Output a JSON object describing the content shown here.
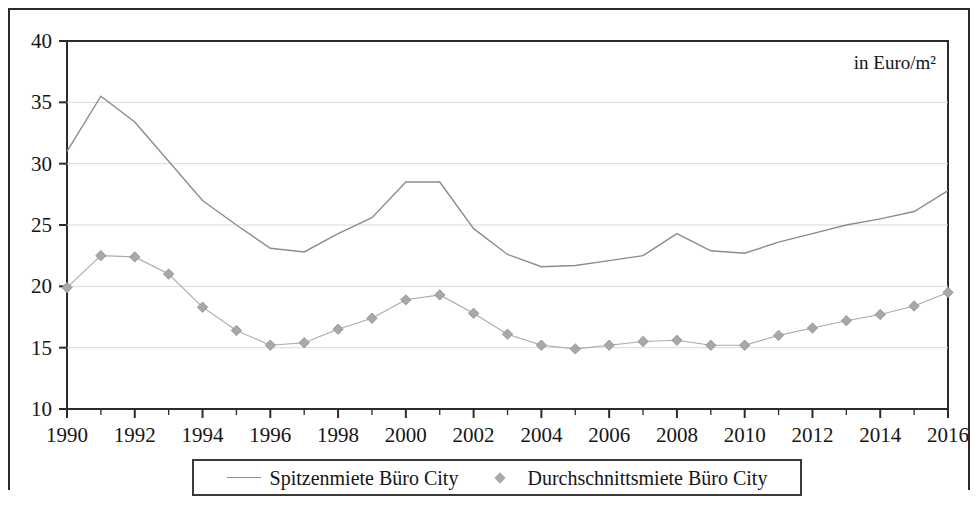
{
  "figure": {
    "unit_note": "in Euro/m²"
  },
  "legend": {
    "entries": [
      {
        "label": "Spitzenmiete Büro City",
        "marker": "line",
        "color": "#8c8c8c"
      },
      {
        "label": "Durchschnittsmiete Büro City",
        "marker": "diamond",
        "color": "#aaaaaa"
      }
    ]
  },
  "chart_data": {
    "type": "line",
    "title": "",
    "subtitle": "",
    "xlabel": "",
    "ylabel": "",
    "annotations": [
      "in Euro/m²"
    ],
    "grid": true,
    "grid_axis": "y",
    "legend_position": "bottom",
    "xlim": [
      1990,
      2016
    ],
    "ylim": [
      10,
      40
    ],
    "yticks": [
      10,
      15,
      20,
      25,
      30,
      35,
      40
    ],
    "ytick_labels": [
      "10",
      "15",
      "20",
      "25",
      "30",
      "35",
      "40"
    ],
    "x": [
      1990,
      1991,
      1992,
      1993,
      1994,
      1995,
      1996,
      1997,
      1998,
      1999,
      2000,
      2001,
      2002,
      2003,
      2004,
      2005,
      2006,
      2007,
      2008,
      2009,
      2010,
      2011,
      2012,
      2013,
      2014,
      2015,
      2016
    ],
    "xticks": [
      1990,
      1991,
      1992,
      1993,
      1994,
      1995,
      1996,
      1997,
      1998,
      1999,
      2000,
      2001,
      2002,
      2003,
      2004,
      2005,
      2006,
      2007,
      2008,
      2009,
      2010,
      2011,
      2012,
      2013,
      2014,
      2015,
      2016
    ],
    "xtick_labels_shown": [
      "1990",
      "1992",
      "1994",
      "1996",
      "1998",
      "2000",
      "2002",
      "2004",
      "2006",
      "2008",
      "2010",
      "2012",
      "2014",
      "2016"
    ],
    "series": [
      {
        "name": "Spitzenmiete Büro City",
        "color": "#8c8c8c",
        "marker": "none",
        "values": [
          31.0,
          35.5,
          33.4,
          30.2,
          27.0,
          25.0,
          23.1,
          22.8,
          24.3,
          25.6,
          28.5,
          28.5,
          24.7,
          22.6,
          21.6,
          21.7,
          22.1,
          22.5,
          24.3,
          22.9,
          22.7,
          23.6,
          24.3,
          25.0,
          25.5,
          26.1,
          27.8
        ]
      },
      {
        "name": "Durchschnittsmiete Büro City",
        "color": "#aaaaaa",
        "marker": "diamond",
        "values": [
          19.9,
          22.5,
          22.4,
          21.0,
          18.3,
          16.4,
          15.2,
          15.4,
          16.5,
          17.4,
          18.9,
          19.3,
          17.8,
          16.1,
          15.2,
          14.9,
          15.2,
          15.5,
          15.6,
          15.2,
          15.2,
          16.0,
          16.6,
          17.2,
          17.7,
          18.4,
          19.5
        ]
      }
    ]
  }
}
